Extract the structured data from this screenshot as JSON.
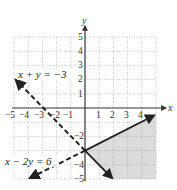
{
  "figure": {
    "type": "system-of-linear-inequalities-graph",
    "axes": {
      "x_label": "x",
      "y_label": "y",
      "x_range": [
        -5,
        5
      ],
      "y_range": [
        -5,
        5
      ],
      "x_ticks_negative": [
        "−5",
        "−4",
        "−3",
        "−2",
        "−1"
      ],
      "x_ticks_positive": [
        "1",
        "2",
        "3",
        "4"
      ],
      "y_ticks_positive": [
        "5",
        "4",
        "3",
        "2",
        "1"
      ],
      "y_ticks_negative": [
        "−1",
        "−2",
        "−3",
        "−4",
        "−5"
      ],
      "grid": "dotted"
    },
    "lines": [
      {
        "label": "x + y = −3",
        "style": "dashed",
        "from": [
          -5,
          2
        ],
        "to": [
          2,
          -5
        ]
      },
      {
        "label": "x − 2y = 6",
        "style": "dashed",
        "from": [
          -4,
          -5
        ],
        "to": [
          0,
          -3
        ]
      }
    ],
    "solid_rays": [
      {
        "from": [
          0,
          -3
        ],
        "to": [
          5,
          -0.5
        ]
      },
      {
        "from": [
          0,
          -3
        ],
        "to": [
          2,
          -5
        ]
      }
    ],
    "shaded_region": {
      "description": "Region bounded by rays from (0,-3) toward (5,-0.5) and toward (2,-5)",
      "color": "#dcdcdc"
    },
    "colors": {
      "axis": "#333333",
      "grid": "#9a9a9a",
      "line": "#222222",
      "shade": "#dcdcdc"
    }
  }
}
